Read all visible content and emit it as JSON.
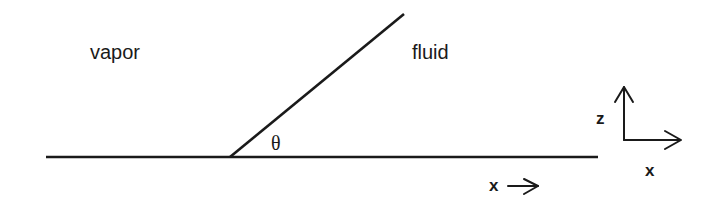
{
  "diagram": {
    "type": "contact-angle-schematic",
    "regions": {
      "vapor_label": "vapor",
      "fluid_label": "fluid"
    },
    "angle_label": "θ",
    "surface_direction_label": "x",
    "axes": {
      "vertical_label": "z",
      "horizontal_label": "x"
    },
    "colors": {
      "stroke": "#1a1a1a",
      "background": "#ffffff"
    }
  }
}
